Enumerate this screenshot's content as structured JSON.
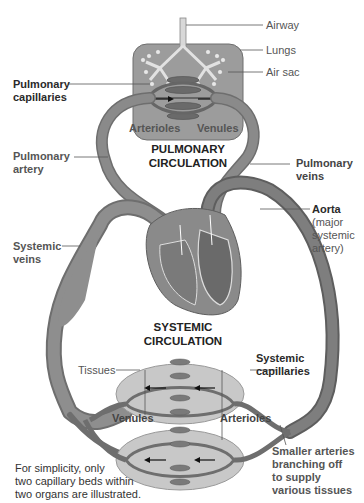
{
  "diagram": {
    "titles": {
      "pulmonary": [
        "PULMONARY",
        "CIRCULATION"
      ],
      "systemic": [
        "SYSTEMIC",
        "CIRCULATION"
      ]
    },
    "labels": {
      "airway": "Airway",
      "lungs": "Lungs",
      "air_sac": "Air sac",
      "pulmonary_capillaries": [
        "Pulmonary",
        "capillaries"
      ],
      "arterioles_top": "Arterioles",
      "venules_top": "Venules",
      "pulmonary_artery": [
        "Pulmonary",
        "artery"
      ],
      "pulmonary_veins": [
        "Pulmonary",
        "veins"
      ],
      "aorta": "Aorta",
      "aorta_note": [
        "(major",
        "systemic",
        "artery)"
      ],
      "systemic_veins": [
        "Systemic",
        "veins"
      ],
      "tissues": "Tissues",
      "systemic_capillaries": [
        "Systemic",
        "capillaries"
      ],
      "venules_bottom": "Venules",
      "arterioles_bottom": "Arterioles",
      "smaller_arteries": [
        "Smaller arteries",
        "branching off",
        "to supply",
        "various tissues"
      ],
      "footnote": [
        "For simplicity, only",
        "two capillary beds within",
        "two organs are illustrated."
      ]
    },
    "colors": {
      "vessel": "#7a7a7a",
      "vessel_dark": "#5e5e5e",
      "lung_box": "#9a9a9a",
      "tissue_oval": "#c4c4c4",
      "heart": "#8c8c8c",
      "leader_line": "#555555"
    }
  }
}
